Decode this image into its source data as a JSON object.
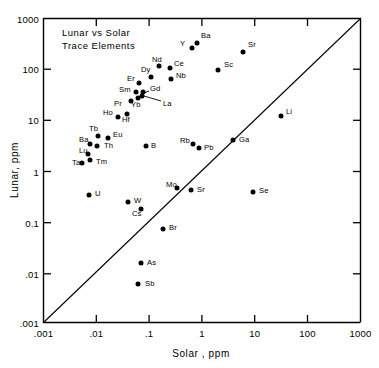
{
  "chart_data": {
    "type": "scatter",
    "xlabel": "Solar , ppm",
    "ylabel": "Lunar, ppm",
    "xscale": "log",
    "yscale": "log",
    "xlim": [
      0.001,
      1000
    ],
    "ylim": [
      0.001,
      1000
    ],
    "grid": false,
    "legend": null,
    "xticks": [
      ".001",
      ".01",
      ".1",
      "1",
      "10",
      "100",
      "1000"
    ],
    "yticks": [
      ".001",
      ".01",
      "0.1",
      "1",
      "10",
      "100",
      "1000"
    ],
    "xtick_values": [
      0.001,
      0.01,
      0.1,
      1,
      10,
      100,
      1000
    ],
    "ytick_values": [
      0.001,
      0.01,
      0.1,
      1,
      10,
      100,
      1000
    ],
    "reference_line": {
      "label": "1:1 line",
      "from": [
        0.001,
        0.001
      ],
      "to": [
        1000,
        1000
      ]
    },
    "series": [
      {
        "name": "Trace elements",
        "points": [
          {
            "label": "Ba",
            "x": 0.95,
            "y": 110.0,
            "lx": 201,
            "ly": 36,
            "px": 197,
            "py": 43
          },
          {
            "label": "Y",
            "x": 0.6,
            "y": 80.0,
            "lx": 180,
            "ly": 44,
            "px": 192,
            "py": 48
          },
          {
            "label": "Sr",
            "x": 5.2,
            "y": 70.0,
            "lx": 248,
            "ly": 45,
            "px": 243,
            "py": 52
          },
          {
            "label": "Sc",
            "x": 1.8,
            "y": 33.0,
            "lx": 224,
            "ly": 65,
            "px": 218,
            "py": 70
          },
          {
            "label": "Nd",
            "x": 0.17,
            "y": 60.0,
            "lx": 152,
            "ly": 60,
            "px": 159,
            "py": 66
          },
          {
            "label": "Ce",
            "x": 0.3,
            "y": 52.0,
            "lx": 174,
            "ly": 64,
            "px": 170,
            "py": 68
          },
          {
            "label": "Nb",
            "x": 0.28,
            "y": 33.0,
            "lx": 176,
            "ly": 76,
            "px": 171,
            "py": 79
          },
          {
            "label": "Dy",
            "x": 0.145,
            "y": 35.0,
            "lx": 141,
            "ly": 70,
            "px": 151,
            "py": 77
          },
          {
            "label": "Er",
            "x": 0.085,
            "y": 26.0,
            "lx": 127,
            "ly": 79,
            "px": 139,
            "py": 83
          },
          {
            "label": "Gd",
            "x": 0.115,
            "y": 20.0,
            "lx": 150,
            "ly": 89,
            "px": 143,
            "py": 92
          },
          {
            "label": "Sm",
            "x": 0.082,
            "y": 20.0,
            "lx": 119,
            "ly": 90,
            "px": 136,
            "py": 92
          },
          {
            "label": "Yb",
            "x": 0.093,
            "y": 15.0,
            "lx": 131,
            "ly": 105,
            "px": 138,
            "py": 98
          },
          {
            "label": "La",
            "x": 0.105,
            "y": 14.0,
            "lx": 163,
            "ly": 104,
            "px": 142,
            "py": 96
          },
          {
            "label": "Pr",
            "x": 0.062,
            "y": 13.0,
            "lx": 114,
            "ly": 104,
            "px": 131,
            "py": 101
          },
          {
            "label": "Ho",
            "x": 0.038,
            "y": 9.5,
            "lx": 103,
            "ly": 113,
            "px": 118,
            "py": 117
          },
          {
            "label": "Hf",
            "x": 0.06,
            "y": 8.5,
            "lx": 122,
            "ly": 120,
            "px": 127,
            "py": 114
          },
          {
            "label": "Li",
            "x": 2.2,
            "y": 11.0,
            "lx": 286,
            "ly": 112,
            "px": 281,
            "py": 116
          },
          {
            "label": "Tb",
            "x": 0.02,
            "y": 4.5,
            "lx": 89,
            "ly": 129,
            "px": 98,
            "py": 136
          },
          {
            "label": "Eu",
            "x": 0.03,
            "y": 4.2,
            "lx": 113,
            "ly": 135,
            "px": 108,
            "py": 138
          },
          {
            "label": "Ba2",
            "x": 0.0145,
            "y": 3.3,
            "lx": 79,
            "ly": 140,
            "px": 90,
            "py": 144,
            "text": "Ba"
          },
          {
            "label": "Th",
            "x": 0.019,
            "y": 3.0,
            "lx": 104,
            "ly": 146,
            "px": 97,
            "py": 146
          },
          {
            "label": "B",
            "x": 0.3,
            "y": 3.2,
            "lx": 151,
            "ly": 146,
            "px": 146,
            "py": 146
          },
          {
            "label": "Rb",
            "x": 1.0,
            "y": 3.4,
            "lx": 180,
            "ly": 141,
            "px": 193,
            "py": 144
          },
          {
            "label": "Pb",
            "x": 1.25,
            "y": 2.9,
            "lx": 204,
            "ly": 148,
            "px": 199,
            "py": 148
          },
          {
            "label": "Ga",
            "x": 4.0,
            "y": 4.0,
            "lx": 239,
            "ly": 140,
            "px": 233,
            "py": 140
          },
          {
            "label": "Lu",
            "x": 0.013,
            "y": 2.1,
            "lx": 79,
            "ly": 151,
            "px": 88,
            "py": 154
          },
          {
            "label": "Tm",
            "x": 0.014,
            "y": 1.6,
            "lx": 96,
            "ly": 162,
            "px": 90,
            "py": 160
          },
          {
            "label": "Ta",
            "x": 0.0085,
            "y": 1.45,
            "lx": 72,
            "ly": 163,
            "px": 82,
            "py": 163
          },
          {
            "label": "U",
            "x": 0.0135,
            "y": 0.5,
            "lx": 95,
            "ly": 194,
            "px": 89,
            "py": 195
          },
          {
            "label": "Mo",
            "x": 0.85,
            "y": 0.8,
            "lx": 166,
            "ly": 185,
            "px": 177,
            "py": 188
          },
          {
            "label": "Sr2",
            "x": 1.15,
            "y": 0.62,
            "lx": 197,
            "ly": 190,
            "px": 191,
            "py": 190,
            "text": "Sr"
          },
          {
            "label": "Se",
            "x": 7.0,
            "y": 0.62,
            "lx": 259,
            "ly": 191,
            "px": 253,
            "py": 192
          },
          {
            "label": "W",
            "x": 0.16,
            "y": 0.38,
            "lx": 134,
            "ly": 201,
            "px": 128,
            "py": 202
          },
          {
            "label": "Cs",
            "x": 0.23,
            "y": 0.29,
            "lx": 132,
            "ly": 214,
            "px": 141,
            "py": 209
          },
          {
            "label": "Br",
            "x": 0.55,
            "y": 0.16,
            "lx": 169,
            "ly": 228,
            "px": 163,
            "py": 229
          },
          {
            "label": "As",
            "x": 0.23,
            "y": 0.055,
            "lx": 147,
            "ly": 263,
            "px": 141,
            "py": 263
          },
          {
            "label": "Sb",
            "x": 0.4,
            "y": 0.0062,
            "lx": 145,
            "ly": 284,
            "px": 138,
            "py": 284
          }
        ]
      }
    ]
  },
  "axes": {
    "x_title": "Solar , ppm",
    "y_title": "Lunar, ppm",
    "x_tick_labels": [
      ".001",
      ".01",
      ".1",
      "1",
      "10",
      "100",
      "1000"
    ],
    "y_tick_labels": [
      "1000",
      "100",
      "10",
      "1",
      "0.1",
      ".01",
      ".001"
    ]
  },
  "title_block": {
    "line1": "Lunar  vs  Solar",
    "line2": "Trace  Elements"
  }
}
